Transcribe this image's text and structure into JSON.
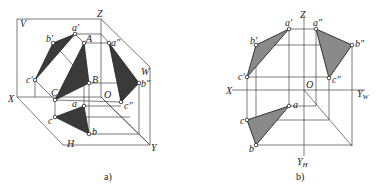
{
  "figure_a": {
    "caption": "a)",
    "labels": {
      "V": "V",
      "Z": "Z",
      "X": "X",
      "O": "O",
      "W": "W",
      "H": "H",
      "Y": "Y",
      "a_prime": "a'",
      "b_prime": "b'",
      "c_prime": "c'",
      "A": "A",
      "B": "B",
      "C": "C",
      "a_dprime": "a″",
      "b_dprime": "b″",
      "c_dprime": "c″",
      "a": "a",
      "b": "b",
      "c": "c"
    }
  },
  "figure_b": {
    "caption": "b)",
    "labels": {
      "Z": "Z",
      "X": "X",
      "O": "O",
      "YW": "Y",
      "YW_sub": "W",
      "YH": "Y",
      "YH_sub": "H",
      "a_prime": "a'",
      "b_prime": "b'",
      "c_prime": "c'",
      "a_dprime": "a″",
      "b_dprime": "b″",
      "c_dprime": "c″",
      "a": "a",
      "b": "b",
      "c": "c"
    }
  },
  "colors": {
    "dark_fill": "#3a3a3a",
    "grey_fill": "#8a8a8a",
    "line": "#444444"
  }
}
